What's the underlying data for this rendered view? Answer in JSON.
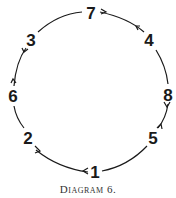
{
  "caption": "Diagram 6.",
  "nodes": [
    {
      "label": "7",
      "x": 91,
      "y": 13
    },
    {
      "label": "4",
      "x": 149,
      "y": 40
    },
    {
      "label": "8",
      "x": 168,
      "y": 95
    },
    {
      "label": "5",
      "x": 153,
      "y": 138
    },
    {
      "label": "1",
      "x": 95,
      "y": 172
    },
    {
      "label": "2",
      "x": 28,
      "y": 138
    },
    {
      "label": "6",
      "x": 13,
      "y": 96
    },
    {
      "label": "3",
      "x": 31,
      "y": 40
    }
  ],
  "colors": {
    "stroke": "#1a1a1a",
    "text": "#1a1a1a"
  }
}
